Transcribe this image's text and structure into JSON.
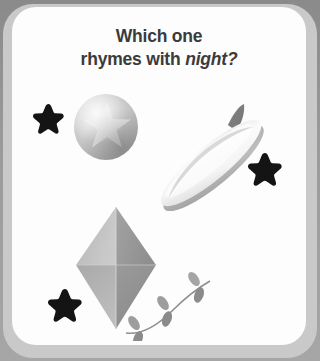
{
  "page": {
    "background_color": "#919191",
    "bezel_color": "#c9c9c9",
    "card_color": "#fdfdfd"
  },
  "question": {
    "line1": "Which one",
    "line2_prefix": "rhymes with ",
    "line2_emphasis": "night?",
    "text_color": "#3b3b3b"
  },
  "decorations": {
    "star_color": "#141414",
    "stars": [
      {
        "name": "star-top-left",
        "x": 33,
        "y": 103,
        "size": 31
      },
      {
        "name": "star-right",
        "x": 248,
        "y": 152,
        "size": 34
      },
      {
        "name": "star-bottom-left",
        "x": 48,
        "y": 288,
        "size": 34
      }
    ]
  },
  "answers": [
    {
      "name": "ball",
      "label": "ball",
      "description": "gray sphere with a star pattern",
      "color": "#c3c3c3"
    },
    {
      "name": "surfboard",
      "label": "surfboard",
      "description": "white surfboard tilted diagonally with a dark fin",
      "color": "#e9e9e9"
    },
    {
      "name": "kite",
      "label": "kite",
      "description": "gray diamond kite with a curling tail of bows",
      "color": "#b0b0b0"
    }
  ]
}
